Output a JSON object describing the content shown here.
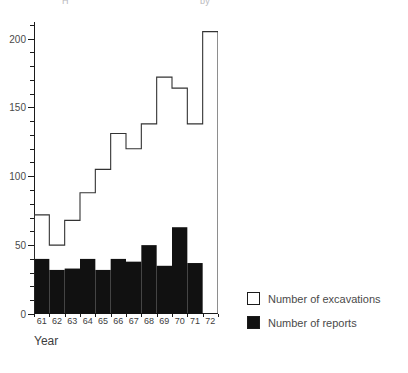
{
  "top_clipped_text": {
    "left_fragment": "H",
    "right_fragment": "by"
  },
  "axes": {
    "xlabel": "Year",
    "ylabel": "",
    "y_ticks": [
      0,
      50,
      100,
      150,
      200
    ],
    "y_minor_step": 10,
    "ylim": [
      0,
      212
    ]
  },
  "legend": {
    "position": "right",
    "entries": [
      {
        "label": "Number of excavations",
        "style": "hollow",
        "color": "#ffffff"
      },
      {
        "label": "Number of reports",
        "style": "filled",
        "color": "#111111"
      }
    ]
  },
  "chart_data": {
    "type": "bar",
    "title": "",
    "subtitle": "",
    "xlabel": "Year",
    "ylabel": "",
    "ylim": [
      0,
      212
    ],
    "grid": false,
    "legend_position": "right",
    "categories": [
      "61",
      "62",
      "63",
      "64",
      "65",
      "66",
      "67",
      "68",
      "69",
      "70",
      "71",
      "72"
    ],
    "series": [
      {
        "name": "Number of excavations",
        "style": "step-outline",
        "color": "#ffffff",
        "edge_color": "#333333",
        "values": [
          72,
          50,
          68,
          88,
          105,
          131,
          120,
          138,
          172,
          164,
          138,
          205
        ]
      },
      {
        "name": "Number of reports",
        "style": "filled-bar",
        "color": "#111111",
        "values": [
          40,
          32,
          33,
          40,
          32,
          40,
          38,
          50,
          35,
          63,
          37,
          null
        ]
      }
    ]
  }
}
